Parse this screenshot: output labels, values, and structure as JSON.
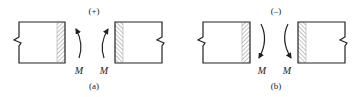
{
  "diagram": {
    "colors": {
      "stroke": "#222222",
      "hatch": "#555555",
      "background": "#ffffff"
    },
    "panels": [
      {
        "id": "a",
        "sign_label": "(+)",
        "caption": "(a)",
        "moment_labels": [
          "M",
          "M"
        ],
        "arrow_direction": "up",
        "description": "Positive moment: arrows curve upward toward the cut faces"
      },
      {
        "id": "b",
        "sign_label": "(–)",
        "caption": "(b)",
        "moment_labels": [
          "M",
          "M"
        ],
        "arrow_direction": "down",
        "description": "Negative moment: arrows curve downward toward the cut faces"
      }
    ]
  }
}
